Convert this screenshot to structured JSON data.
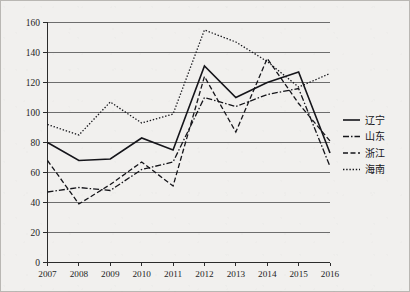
{
  "chart_data": {
    "type": "line",
    "title": "",
    "xlabel": "",
    "ylabel": "",
    "categories": [
      "2007",
      "2008",
      "2009",
      "2010",
      "2011",
      "2012",
      "2013",
      "2014",
      "2015",
      "2016"
    ],
    "x": [
      2007,
      2008,
      2009,
      2010,
      2011,
      2012,
      2013,
      2014,
      2015,
      2016
    ],
    "ylim": [
      0,
      160
    ],
    "yticks": [
      0,
      20,
      40,
      60,
      80,
      100,
      120,
      140,
      160
    ],
    "ytick_labels": [
      "0",
      "20",
      "40",
      "60",
      "80",
      "100",
      "120",
      "140",
      "160"
    ],
    "grid": "horizontal",
    "legend_position": "right",
    "series": [
      {
        "name": "辽宁",
        "style": "solid",
        "color": "#15151a",
        "values": [
          80,
          68,
          69,
          83,
          75,
          131,
          110,
          120,
          127,
          73
        ]
      },
      {
        "name": "山东",
        "style": "dashdot",
        "color": "#15151a",
        "values": [
          47,
          50,
          48,
          62,
          67,
          110,
          104,
          112,
          116,
          64
        ]
      },
      {
        "name": "浙江",
        "style": "dashed",
        "color": "#15151a",
        "values": [
          68,
          39,
          52,
          67,
          51,
          124,
          87,
          136,
          106,
          81
        ]
      },
      {
        "name": "海南",
        "style": "dotted",
        "color": "#15151a",
        "values": [
          92,
          85,
          107,
          93,
          99,
          155,
          147,
          134,
          117,
          126
        ]
      }
    ]
  },
  "legend": {
    "items": [
      {
        "label": "辽宁"
      },
      {
        "label": "山东"
      },
      {
        "label": "浙江"
      },
      {
        "label": "海南"
      }
    ]
  },
  "axis": {
    "y_labels": [
      "160",
      "140",
      "120",
      "100",
      "80",
      "60",
      "40",
      "20",
      "0"
    ],
    "x_labels": [
      "2007",
      "2008",
      "2009",
      "2010",
      "2011",
      "2012",
      "2013",
      "2014",
      "2015",
      "2016"
    ]
  }
}
